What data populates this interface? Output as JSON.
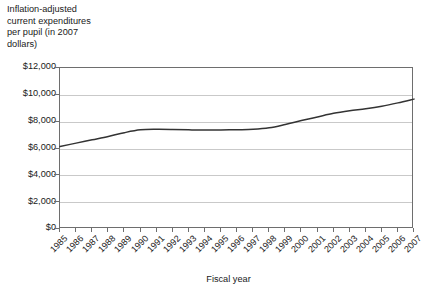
{
  "chart_data": {
    "type": "line",
    "title": "",
    "ylabel": "Inflation-adjusted current expenditures per pupil (in 2007 dollars)",
    "xlabel": "Fiscal year",
    "ylim": [
      0,
      12000
    ],
    "xlim": [
      1985,
      2007
    ],
    "grid": true,
    "legend": "none",
    "y_ticks": [
      0,
      2000,
      4000,
      6000,
      8000,
      10000,
      12000
    ],
    "y_tick_labels": [
      "$0",
      "$2,000",
      "$4,000",
      "$6,000",
      "$8,000",
      "$10,000",
      "$12,000"
    ],
    "categories": [
      "1985",
      "1986",
      "1987",
      "1988",
      "1989",
      "1990",
      "1991",
      "1992",
      "1993",
      "1994",
      "1995",
      "1996",
      "1997",
      "1998",
      "1999",
      "2000",
      "2001",
      "2002",
      "2003",
      "2004",
      "2005",
      "2006",
      "2007"
    ],
    "values": [
      6150,
      6400,
      6650,
      6900,
      7180,
      7390,
      7430,
      7420,
      7390,
      7370,
      7380,
      7400,
      7430,
      7540,
      7790,
      8080,
      8350,
      8620,
      8810,
      8960,
      9150,
      9400,
      9680
    ],
    "series": [
      {
        "name": "Inflation-adjusted current expenditures per pupil",
        "color": "#333333",
        "values": [
          6150,
          6400,
          6650,
          6900,
          7180,
          7390,
          7430,
          7420,
          7390,
          7370,
          7380,
          7400,
          7430,
          7540,
          7790,
          8080,
          8350,
          8620,
          8810,
          8960,
          9150,
          9400,
          9680
        ]
      }
    ]
  },
  "axes": {
    "y_title_text": "Inflation-adjusted\ncurrent expenditures\nper pupil (in 2007\ndollars)",
    "x_title_text": "Fiscal year"
  },
  "colors": {
    "line": "#333333",
    "grid": "#c9c9c9",
    "frame": "#6e6e6e",
    "text": "#1a1a1a",
    "background": "#ffffff"
  }
}
